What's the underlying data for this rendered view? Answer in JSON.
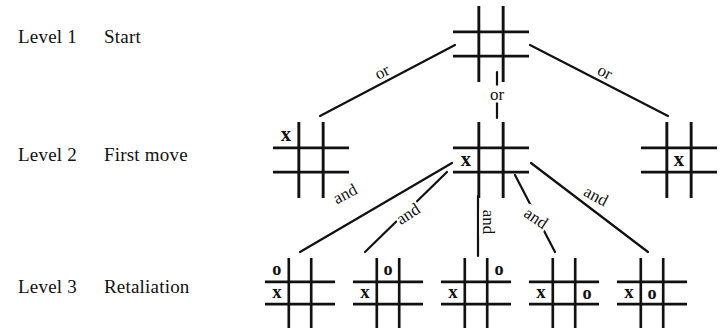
{
  "figure": {
    "kind": "game-tree-diagram",
    "topic": "tic-tac-toe search tree",
    "ink_color": "#111111",
    "background_color": "#ffffff"
  },
  "levels": [
    {
      "id": "level-1",
      "name": "Level 1",
      "title": "Start"
    },
    {
      "id": "level-2",
      "name": "Level 2",
      "title": "First move"
    },
    {
      "id": "level-3",
      "name": "Level 3",
      "title": "Retaliation"
    }
  ],
  "edge_labels": {
    "or": "or",
    "and": "and"
  },
  "edges": [
    {
      "id": "root-to-left",
      "label": "or",
      "x": 382,
      "y": 72,
      "rotate": -27
    },
    {
      "id": "root-to-middle",
      "label": "or",
      "x": 497,
      "y": 94,
      "rotate": 0
    },
    {
      "id": "root-to-right",
      "label": "or",
      "x": 605,
      "y": 72,
      "rotate": 27
    },
    {
      "id": "mid-to-child-1",
      "label": "and",
      "x": 345,
      "y": 194,
      "rotate": -28
    },
    {
      "id": "mid-to-child-2",
      "label": "and",
      "x": 408,
      "y": 214,
      "rotate": -33
    },
    {
      "id": "mid-to-child-3",
      "label": "and",
      "x": 488,
      "y": 222,
      "rotate": 90
    },
    {
      "id": "mid-to-child-4",
      "label": "and",
      "x": 536,
      "y": 218,
      "rotate": 34
    },
    {
      "id": "mid-to-child-5",
      "label": "and",
      "x": 596,
      "y": 196,
      "rotate": 28
    }
  ],
  "boards": [
    {
      "id": "board-root",
      "level": "Level 1",
      "caption": "empty starting board",
      "x": 453,
      "y": 6,
      "size": 76,
      "marks": []
    },
    {
      "id": "board-L2-corner",
      "level": "Level 2",
      "caption": "X in top-left corner",
      "x": 273,
      "y": 122,
      "size": 76,
      "marks": [
        {
          "symbol": "x",
          "row": 0,
          "col": 0
        }
      ]
    },
    {
      "id": "board-L2-edge",
      "level": "Level 2",
      "caption": "X on middle-left edge",
      "x": 453,
      "y": 122,
      "size": 76,
      "marks": [
        {
          "symbol": "x",
          "row": 1,
          "col": 0
        }
      ]
    },
    {
      "id": "board-L2-center",
      "level": "Level 2",
      "caption": "X in center",
      "x": 641,
      "y": 122,
      "size": 76,
      "marks": [
        {
          "symbol": "x",
          "row": 1,
          "col": 1
        }
      ]
    },
    {
      "id": "board-L3-1",
      "level": "Level 3",
      "caption": "X middle-left, O top-left",
      "x": 265,
      "y": 258,
      "size": 70,
      "marks": [
        {
          "symbol": "o",
          "row": 0,
          "col": 0
        },
        {
          "symbol": "x",
          "row": 1,
          "col": 0
        }
      ]
    },
    {
      "id": "board-L3-2",
      "level": "Level 3",
      "caption": "X middle-left, O top-center",
      "x": 353,
      "y": 258,
      "size": 70,
      "marks": [
        {
          "symbol": "o",
          "row": 0,
          "col": 1
        },
        {
          "symbol": "x",
          "row": 1,
          "col": 0
        }
      ]
    },
    {
      "id": "board-L3-3",
      "level": "Level 3",
      "caption": "X middle-left, O top-right",
      "x": 441,
      "y": 258,
      "size": 70,
      "marks": [
        {
          "symbol": "o",
          "row": 0,
          "col": 2
        },
        {
          "symbol": "x",
          "row": 1,
          "col": 0
        }
      ]
    },
    {
      "id": "board-L3-4",
      "level": "Level 3",
      "caption": "X middle-left, O middle-right",
      "x": 529,
      "y": 258,
      "size": 70,
      "marks": [
        {
          "symbol": "x",
          "row": 1,
          "col": 0
        },
        {
          "symbol": "o",
          "row": 1,
          "col": 2
        }
      ]
    },
    {
      "id": "board-L3-5",
      "level": "Level 3",
      "caption": "X middle-left, O center",
      "x": 617,
      "y": 258,
      "size": 70,
      "marks": [
        {
          "symbol": "x",
          "row": 1,
          "col": 0
        },
        {
          "symbol": "o",
          "row": 1,
          "col": 1
        }
      ]
    }
  ],
  "label_positions": [
    {
      "level_index": 0,
      "x": 18,
      "y": 26
    },
    {
      "level_index": 1,
      "x": 18,
      "y": 144
    },
    {
      "level_index": 2,
      "x": 18,
      "y": 276
    }
  ],
  "connector_lines": [
    {
      "id": "line-root-left",
      "x1": 455,
      "y1": 45,
      "x2": 320,
      "y2": 116
    },
    {
      "id": "line-root-center",
      "x1": 497,
      "y1": 72,
      "x2": 497,
      "y2": 118
    },
    {
      "id": "line-root-right",
      "x1": 530,
      "y1": 45,
      "x2": 668,
      "y2": 116
    },
    {
      "id": "line-mid-c1",
      "x1": 452,
      "y1": 163,
      "x2": 300,
      "y2": 252
    },
    {
      "id": "line-mid-c2",
      "x1": 447,
      "y1": 172,
      "x2": 365,
      "y2": 252
    },
    {
      "id": "line-mid-c3",
      "x1": 478,
      "y1": 196,
      "x2": 478,
      "y2": 256
    },
    {
      "id": "line-mid-c4",
      "x1": 515,
      "y1": 175,
      "x2": 555,
      "y2": 252
    },
    {
      "id": "line-mid-c5",
      "x1": 531,
      "y1": 163,
      "x2": 648,
      "y2": 252
    }
  ]
}
